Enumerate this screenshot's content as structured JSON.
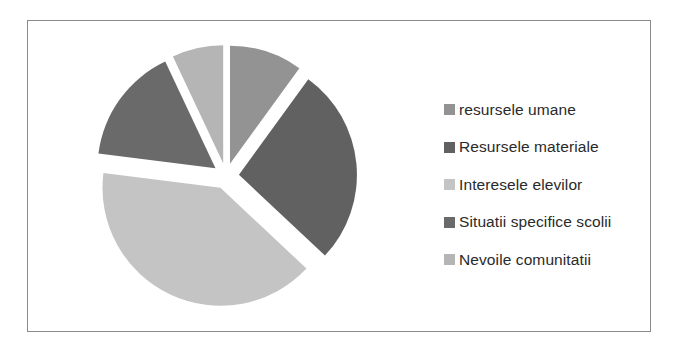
{
  "chart_data": {
    "type": "pie",
    "title": "",
    "exploded": true,
    "start_angle_deg": 0,
    "direction": "clockwise",
    "categories": [
      "resursele umane",
      "Resursele materiale",
      "Interesele elevilor",
      "Situatii specifice scolii",
      "Nevoile comunitatii"
    ],
    "values": [
      10,
      27,
      40,
      16,
      7
    ],
    "colors": [
      "#939393",
      "#616161",
      "#c4c4c4",
      "#6a6a6a",
      "#b5b5b5"
    ],
    "legend_position": "right"
  },
  "legend": {
    "items": [
      {
        "label": "resursele umane",
        "color": "#939393"
      },
      {
        "label": "Resursele materiale",
        "color": "#616161"
      },
      {
        "label": "Interesele elevilor",
        "color": "#c4c4c4"
      },
      {
        "label": "Situatii specifice scolii",
        "color": "#6a6a6a"
      },
      {
        "label": "Nevoile comunitatii",
        "color": "#b5b5b5"
      }
    ]
  }
}
